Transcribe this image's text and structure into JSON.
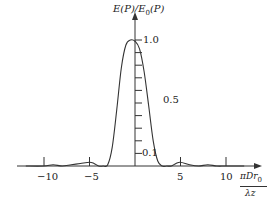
{
  "chart_data": {
    "type": "line",
    "title": "",
    "ylabel": "E(P)/E_0(P)",
    "xlabel": "πDr_0 / λz",
    "x_ticks": [
      -10,
      -5,
      5,
      10
    ],
    "x_tick_labels": [
      "−10",
      "−5",
      "5",
      "10"
    ],
    "y_tick_labels": [
      "1.0",
      "0.5",
      "0.1"
    ],
    "y_ticks": [
      1.0,
      0.5,
      0.1
    ],
    "y_minor_ticks": [
      0.1,
      0.2,
      0.3,
      0.4,
      0.5,
      0.6,
      0.7,
      0.8,
      0.9,
      1.0
    ],
    "xlim": [
      -12,
      12
    ],
    "ylim": [
      0,
      1.1
    ],
    "grid": false,
    "legend": "none",
    "series": [
      {
        "name": "normalized field",
        "x": [
          -12,
          -10,
          -9,
          -8,
          -7,
          -6,
          -5,
          -4.5,
          -4,
          -3.5,
          -3,
          -2.5,
          -2,
          -1.5,
          -1,
          -0.5,
          0,
          0.5,
          1,
          1.5,
          2,
          2.5,
          3,
          3.5,
          4,
          4.5,
          5,
          6,
          7,
          8,
          9,
          10,
          12
        ],
        "y": [
          0.0,
          0.0,
          0.01,
          0.0,
          0.01,
          0.02,
          0.03,
          0.02,
          0.0,
          0.0,
          0.01,
          0.15,
          0.45,
          0.78,
          0.96,
          1.0,
          0.99,
          0.93,
          0.75,
          0.48,
          0.2,
          0.04,
          0.0,
          0.0,
          0.0,
          0.02,
          0.03,
          0.01,
          0.0,
          0.01,
          0.0,
          0.0,
          0.0
        ]
      }
    ]
  },
  "labels": {
    "y_axis_title": "E(P)/E",
    "y_axis_sub": "0",
    "y_axis_tail": "(P)",
    "x_axis_num": "πDr",
    "x_axis_num_sub": "0",
    "x_axis_den": "λz"
  }
}
